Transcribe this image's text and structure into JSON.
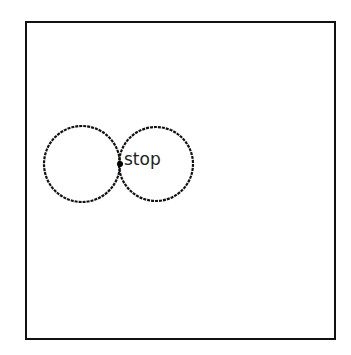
{
  "canvas": {
    "label": "stop",
    "stroke_color": "#111111",
    "circles": [
      {
        "cx": 82,
        "cy": 164,
        "r": 38
      },
      {
        "cx": 156,
        "cy": 164,
        "r": 37
      }
    ],
    "marker": {
      "cx": 120,
      "cy": 164,
      "r": 3
    }
  }
}
